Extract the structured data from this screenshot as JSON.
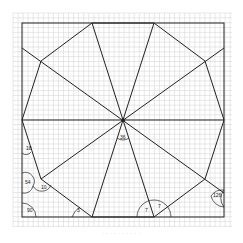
{
  "diagram": {
    "type": "geometry-figure",
    "colors": {
      "grid": "#cfcfcf",
      "line": "#222222",
      "background": "#ffffff"
    },
    "angle_labels": [
      {
        "id": "center",
        "text": "36",
        "x": 120,
        "y": 139
      },
      {
        "id": "left-upper",
        "text": "18",
        "x": 26,
        "y": 150
      },
      {
        "id": "left-mid",
        "text": "54",
        "x": 25,
        "y": 184
      },
      {
        "id": "vertex-ll",
        "text": "10",
        "x": 41,
        "y": 189
      },
      {
        "id": "corner-bl",
        "text": "90",
        "x": 27,
        "y": 212
      },
      {
        "id": "bottom-left-v",
        "text": "3",
        "x": 77,
        "y": 212
      },
      {
        "id": "bottom-right-v-left",
        "text": "7",
        "x": 145,
        "y": 212
      },
      {
        "id": "bottom-right-v-right",
        "text": "7",
        "x": 158,
        "y": 208
      },
      {
        "id": "right-lower",
        "text": "126",
        "x": 213,
        "y": 197
      }
    ]
  },
  "caption": "· · · · · · · · · ·"
}
